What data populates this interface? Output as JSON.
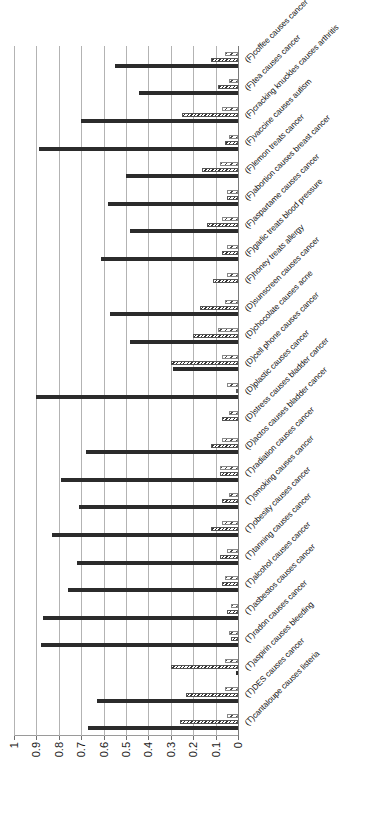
{
  "chart_data": {
    "type": "bar",
    "orientation": "horizontal",
    "title": "",
    "xlabel": "",
    "ylabel": "",
    "ylim": [
      0,
      1
    ],
    "grid": true,
    "legend": "none",
    "tick_labels": [
      "1",
      "0.9",
      "0.8",
      "0.7",
      "0.6",
      "0.5",
      "0.4",
      "0.3",
      "0.2",
      "0.1",
      "0"
    ],
    "tick_values": [
      1,
      0.9,
      0.8,
      0.7,
      0.6,
      0.5,
      0.4,
      0.3,
      0.2,
      0.1,
      0
    ],
    "categories": [
      "(T)cantaloupe causes listeria",
      "(T)DES causes cancer",
      "(T)aspirin causes bleeding",
      "(T)radon causes cancer",
      "(T)asbestos causes cancer",
      "(T)alcohol causes cancer",
      "(T)tanning causes cancer",
      "(T)obesity causes cancer",
      "(T)smoking causes cancer",
      "(T)radiation causes cancer",
      "(D)actos causes bladder cancer",
      "(D)stress causes bladder cancer",
      "(D)plastic causes cancer",
      "(D)cell phone causes cancer",
      "(D)chocolate causes acne",
      "(D)sunscreen causes cancer",
      "(F)honey treats allergy",
      "(F)garlic treats blood pressure",
      "(F)aspartame causes cancer",
      "(F)abortion causes breast cancer",
      "(F)lemon treats cancer",
      "(F)vaccine causes autism",
      "(F)cracking knuckles causes arthritis",
      "(F)tea causes cancer",
      "(F)coffee causes cancer"
    ],
    "series": [
      {
        "name": "series-solid",
        "style": "solid-dark",
        "color": "#2b2b2b",
        "values": [
          0.67,
          0.63,
          0.01,
          0.88,
          0.87,
          0.76,
          0.72,
          0.83,
          0.71,
          0.79,
          0.68,
          0.0,
          0.9,
          0.29,
          0.48,
          0.57,
          0.0,
          0.61,
          0.48,
          0.58,
          0.5,
          0.89,
          0.7,
          0.44,
          0.55
        ]
      },
      {
        "name": "series-dense-hatch",
        "style": "dense-hatch",
        "color": "#333333",
        "values": [
          0.26,
          0.23,
          0.3,
          0.03,
          0.05,
          0.07,
          0.08,
          0.12,
          0.07,
          0.08,
          0.12,
          0.07,
          0.01,
          0.3,
          0.2,
          0.17,
          0.11,
          0.07,
          0.14,
          0.05,
          0.16,
          0.06,
          0.25,
          0.09,
          0.12
        ]
      },
      {
        "name": "series-light-hatch",
        "style": "light-hatch",
        "color": "#4a4a4a",
        "values": [
          0.05,
          0.06,
          0.06,
          0.04,
          0.03,
          0.06,
          0.05,
          0.07,
          0.04,
          0.08,
          0.07,
          0.04,
          0.05,
          0.07,
          0.09,
          0.06,
          0.05,
          0.05,
          0.07,
          0.05,
          0.08,
          0.04,
          0.07,
          0.04,
          0.06
        ]
      }
    ]
  }
}
